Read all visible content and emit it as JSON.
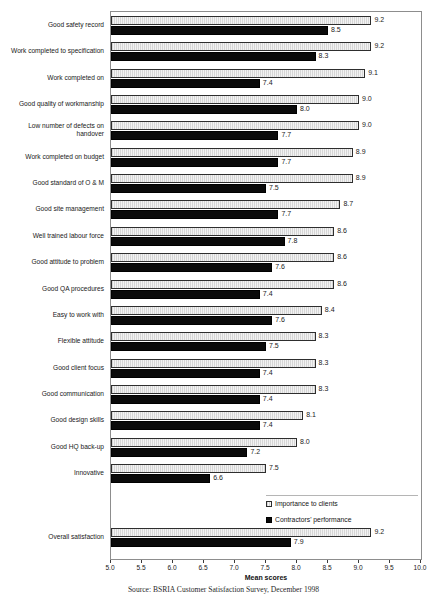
{
  "figure": {
    "clipped_header": "",
    "source_note": "Source:  BSRIA Customer Satisfaction Survey,  December 1998"
  },
  "legend": {
    "position": "inside-bottom-right",
    "items": [
      {
        "name": "importance",
        "label": "Importance to clients",
        "color": "#e8e8e8"
      },
      {
        "name": "performance",
        "label": "Contractors' performance",
        "color": "#0a0a0a"
      }
    ]
  },
  "chart_data": {
    "type": "bar",
    "orientation": "horizontal",
    "title": "",
    "xlabel": "Mean scores",
    "ylabel": "",
    "xlim": [
      5.0,
      10.0
    ],
    "xticks": [
      "5.0",
      "5.5",
      "6.0",
      "6.5",
      "7.0",
      "7.5",
      "8.0",
      "8.5",
      "9.0",
      "9.5",
      "10.0"
    ],
    "grid": false,
    "categories": [
      "Good safety record",
      "Work completed to specification",
      "Work completed on",
      "Good quality of workmanship",
      "Low number of defects on handover",
      "Work completed on budget",
      "Good standard of O & M",
      "Good site management",
      "Well trained labour force",
      "Good attitude to problem",
      "Good QA procedures",
      "Easy to work with",
      "Flexible attitude",
      "Good client focus",
      "Good communication",
      "Good design skills",
      "Good HQ back-up",
      "Innovative",
      "Overall satisfaction"
    ],
    "series": [
      {
        "name": "Importance to clients",
        "values": [
          9.2,
          9.2,
          9.1,
          9.0,
          9.0,
          8.9,
          8.9,
          8.7,
          8.6,
          8.6,
          8.6,
          8.4,
          8.3,
          8.3,
          8.3,
          8.1,
          8.0,
          7.5,
          9.2
        ],
        "labels": [
          "9.2",
          "9.2",
          "9.1",
          "9.0",
          "9.0",
          "8.9",
          "8.9",
          "8.7",
          "8.6",
          "8.6",
          "8.6",
          "8.4",
          "8.3",
          "8.3",
          "8.3",
          "8.1",
          "8.0",
          "7.5",
          "9.2"
        ]
      },
      {
        "name": "Contractors' performance",
        "values": [
          8.5,
          8.3,
          7.4,
          8.0,
          7.7,
          7.7,
          7.5,
          7.7,
          7.8,
          7.6,
          7.4,
          7.6,
          7.5,
          7.4,
          7.4,
          7.4,
          7.2,
          6.6,
          7.9
        ],
        "labels": [
          "8.5",
          "8.3",
          "7.4",
          "8.0",
          "7.7",
          "7.7",
          "7.5",
          "7.7",
          "7.8",
          "7.6",
          "7.4",
          "7.6",
          "7.5",
          "7.4",
          "7.4",
          "7.4",
          "7.2",
          "6.6",
          "7.9"
        ]
      }
    ]
  }
}
